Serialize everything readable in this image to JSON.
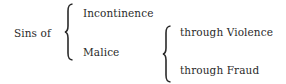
{
  "diagram": {
    "root": {
      "label": "Sins of"
    },
    "level1": [
      {
        "label": "Incontinence"
      },
      {
        "label": "Malice"
      }
    ],
    "level2": {
      "parent": "Malice",
      "children": [
        {
          "label": "through Violence"
        },
        {
          "label": "through Fraud"
        }
      ]
    },
    "colors": {
      "text": "#2a2a2a",
      "background": "#ffffff"
    }
  }
}
